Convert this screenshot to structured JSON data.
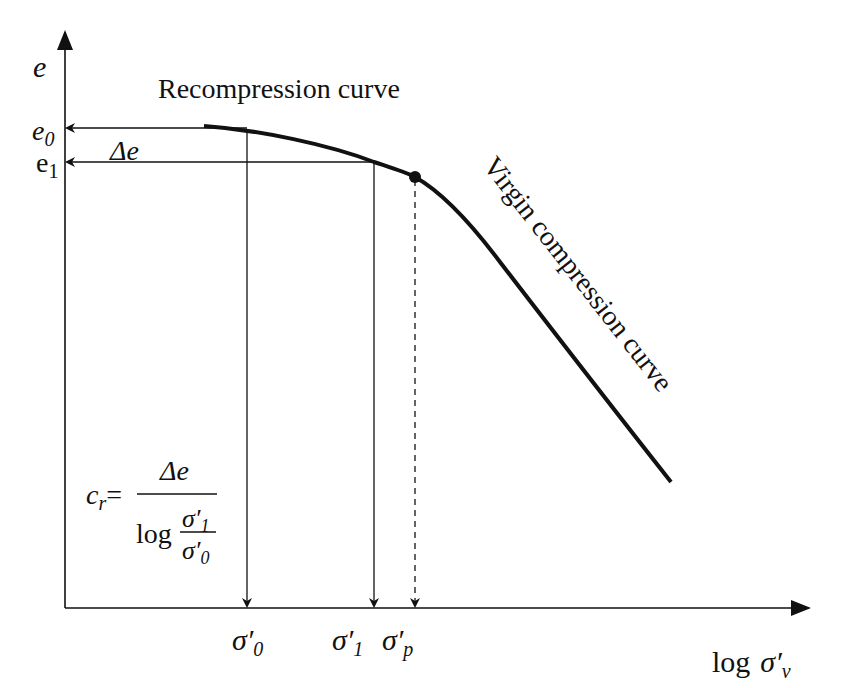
{
  "diagram": {
    "colors": {
      "ink": "#111111",
      "background": "#ffffff"
    },
    "axes": {
      "y_label": "e",
      "x_label_prefix": "log",
      "x_label_symbol": "σ′",
      "x_label_sub": "v"
    },
    "y_ticks": [
      {
        "id": "e0",
        "base": "e",
        "sub": "0",
        "italic": true
      },
      {
        "id": "e1",
        "base": "e",
        "sub": "1",
        "italic": false
      }
    ],
    "x_ticks": [
      {
        "id": "sigma0",
        "base": "σ′",
        "sub": "0",
        "line": "solid-arrow"
      },
      {
        "id": "sigma1",
        "base": "σ′",
        "sub": "1",
        "line": "solid-arrow"
      },
      {
        "id": "sigmap",
        "base": "σ′",
        "sub": "p",
        "line": "dashed-arrow"
      }
    ],
    "annotations": {
      "recompression_label": "Recompression curve",
      "virgin_label": "Virgin compression curve",
      "delta_e": "Δe",
      "preconsolidation_point": "σ′p (marked dot on curve)"
    },
    "formula": {
      "lhs_base": "c",
      "lhs_sub": "r",
      "equals": "=",
      "numerator": "Δe",
      "denominator_prefix": "log",
      "inner_numerator_base": "σ′",
      "inner_numerator_sub": "1",
      "inner_denominator_base": "σ′",
      "inner_denominator_sub": "0"
    }
  }
}
